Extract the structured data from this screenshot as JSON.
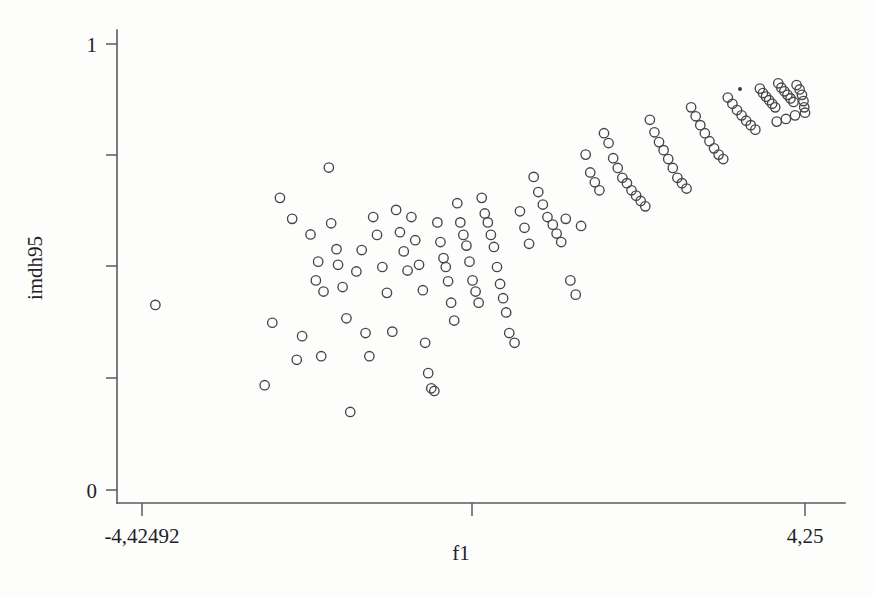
{
  "figure": {
    "background_color": "#fdfdfc",
    "ink_color": "#46464a",
    "marker": "open-circle"
  },
  "chart_data": {
    "type": "scatter",
    "title": "",
    "subtitle": "",
    "xlabel": "f1",
    "ylabel": "imdh95",
    "xlim": [
      -4.42492,
      4.25
    ],
    "ylim": [
      0,
      1
    ],
    "grid": false,
    "legend": null,
    "x_tick_labels": [
      "-4,42492",
      "4,25"
    ],
    "y_tick_labels": [
      "1",
      "0"
    ],
    "x_minor_ticks": 1,
    "y_minor_ticks": 3,
    "marker_style": "open circle, no fill",
    "n_points": 137,
    "relationship": "positive association between f1 and imdh95; spread is wide at low f1 and tightens near imdh95 = 0.9 at high f1",
    "points": [
      [
        -4.25,
        0.415
      ],
      [
        -2.62,
        0.655
      ],
      [
        -2.72,
        0.375
      ],
      [
        -2.82,
        0.235
      ],
      [
        -2.46,
        0.608
      ],
      [
        -2.33,
        0.345
      ],
      [
        -2.4,
        0.292
      ],
      [
        -2.22,
        0.573
      ],
      [
        -2.12,
        0.512
      ],
      [
        -2.15,
        0.47
      ],
      [
        -2.05,
        0.445
      ],
      [
        -2.08,
        0.3
      ],
      [
        -1.98,
        0.723
      ],
      [
        -1.95,
        0.598
      ],
      [
        -1.88,
        0.54
      ],
      [
        -1.86,
        0.505
      ],
      [
        -1.8,
        0.455
      ],
      [
        -1.75,
        0.385
      ],
      [
        -1.7,
        0.175
      ],
      [
        -1.62,
        0.49
      ],
      [
        -1.55,
        0.538
      ],
      [
        -1.5,
        0.352
      ],
      [
        -1.45,
        0.3
      ],
      [
        -1.4,
        0.612
      ],
      [
        -1.35,
        0.572
      ],
      [
        -1.28,
        0.5
      ],
      [
        -1.22,
        0.442
      ],
      [
        -1.15,
        0.355
      ],
      [
        -1.1,
        0.628
      ],
      [
        -1.05,
        0.578
      ],
      [
        -1.0,
        0.535
      ],
      [
        -0.95,
        0.492
      ],
      [
        -0.9,
        0.612
      ],
      [
        -0.85,
        0.56
      ],
      [
        -0.8,
        0.505
      ],
      [
        -0.75,
        0.448
      ],
      [
        -0.72,
        0.33
      ],
      [
        -0.68,
        0.262
      ],
      [
        -0.64,
        0.228
      ],
      [
        -0.6,
        0.222
      ],
      [
        -0.56,
        0.6
      ],
      [
        -0.52,
        0.556
      ],
      [
        -0.48,
        0.52
      ],
      [
        -0.45,
        0.5
      ],
      [
        -0.42,
        0.468
      ],
      [
        -0.38,
        0.42
      ],
      [
        -0.34,
        0.38
      ],
      [
        -0.3,
        0.643
      ],
      [
        -0.26,
        0.6
      ],
      [
        -0.22,
        0.572
      ],
      [
        -0.18,
        0.548
      ],
      [
        -0.14,
        0.512
      ],
      [
        -0.1,
        0.47
      ],
      [
        -0.06,
        0.445
      ],
      [
        -0.02,
        0.42
      ],
      [
        0.02,
        0.655
      ],
      [
        0.06,
        0.62
      ],
      [
        0.1,
        0.6
      ],
      [
        0.14,
        0.572
      ],
      [
        0.18,
        0.545
      ],
      [
        0.22,
        0.5
      ],
      [
        0.26,
        0.462
      ],
      [
        0.3,
        0.43
      ],
      [
        0.34,
        0.398
      ],
      [
        0.38,
        0.352
      ],
      [
        0.45,
        0.33
      ],
      [
        0.52,
        0.625
      ],
      [
        0.58,
        0.588
      ],
      [
        0.64,
        0.552
      ],
      [
        0.7,
        0.702
      ],
      [
        0.76,
        0.668
      ],
      [
        0.82,
        0.64
      ],
      [
        0.88,
        0.612
      ],
      [
        0.95,
        0.595
      ],
      [
        1.0,
        0.575
      ],
      [
        1.06,
        0.556
      ],
      [
        1.12,
        0.608
      ],
      [
        1.18,
        0.47
      ],
      [
        1.25,
        0.438
      ],
      [
        1.32,
        0.592
      ],
      [
        1.38,
        0.752
      ],
      [
        1.44,
        0.712
      ],
      [
        1.5,
        0.69
      ],
      [
        1.56,
        0.672
      ],
      [
        1.62,
        0.8
      ],
      [
        1.68,
        0.778
      ],
      [
        1.74,
        0.744
      ],
      [
        1.8,
        0.722
      ],
      [
        1.86,
        0.7
      ],
      [
        1.92,
        0.688
      ],
      [
        1.98,
        0.672
      ],
      [
        2.04,
        0.66
      ],
      [
        2.1,
        0.648
      ],
      [
        2.16,
        0.636
      ],
      [
        2.22,
        0.83
      ],
      [
        2.28,
        0.802
      ],
      [
        2.34,
        0.78
      ],
      [
        2.4,
        0.762
      ],
      [
        2.46,
        0.742
      ],
      [
        2.52,
        0.722
      ],
      [
        2.58,
        0.7
      ],
      [
        2.64,
        0.688
      ],
      [
        2.7,
        0.676
      ],
      [
        2.76,
        0.858
      ],
      [
        2.82,
        0.838
      ],
      [
        2.88,
        0.818
      ],
      [
        2.94,
        0.8
      ],
      [
        3.0,
        0.782
      ],
      [
        3.06,
        0.766
      ],
      [
        3.12,
        0.752
      ],
      [
        3.18,
        0.742
      ],
      [
        3.24,
        0.88
      ],
      [
        3.3,
        0.866
      ],
      [
        3.36,
        0.852
      ],
      [
        3.42,
        0.84
      ],
      [
        3.48,
        0.828
      ],
      [
        3.54,
        0.818
      ],
      [
        3.6,
        0.808
      ],
      [
        3.66,
        0.9
      ],
      [
        3.7,
        0.89
      ],
      [
        3.74,
        0.882
      ],
      [
        3.78,
        0.874
      ],
      [
        3.82,
        0.866
      ],
      [
        3.86,
        0.858
      ],
      [
        3.9,
        0.912
      ],
      [
        3.94,
        0.902
      ],
      [
        3.98,
        0.894
      ],
      [
        4.02,
        0.886
      ],
      [
        4.06,
        0.878
      ],
      [
        4.1,
        0.87
      ],
      [
        4.14,
        0.908
      ],
      [
        4.18,
        0.898
      ],
      [
        4.21,
        0.886
      ],
      [
        4.23,
        0.872
      ],
      [
        4.24,
        0.858
      ],
      [
        4.25,
        0.846
      ],
      [
        4.12,
        0.84
      ],
      [
        4.0,
        0.832
      ],
      [
        3.88,
        0.826
      ]
    ]
  }
}
